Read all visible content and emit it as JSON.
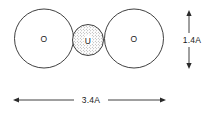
{
  "figure": {
    "background_color": "#ffffff",
    "stroke_color": "#2a2a2a",
    "text_color": "#1a1a1a",
    "atoms": [
      {
        "id": "oxygen-left",
        "label": "O",
        "element": "O",
        "style": "outline",
        "cx": 44,
        "cy": 38.5,
        "r": 29.5
      },
      {
        "id": "uranium-center",
        "label": "U",
        "element": "U",
        "style": "stippled",
        "cx": 88,
        "cy": 40,
        "r": 15.5
      },
      {
        "id": "oxygen-right",
        "label": "O",
        "element": "O",
        "style": "outline",
        "cx": 134,
        "cy": 38.5,
        "r": 29.5
      }
    ],
    "dimensions": [
      {
        "id": "vertical-dimension",
        "label": "1.4A",
        "value": "1.4",
        "unit": "A",
        "orientation": "vertical",
        "x": 189,
        "y_start": 11,
        "y_end": 68,
        "label_x": 193,
        "label_y": 40
      },
      {
        "id": "horizontal-dimension",
        "label": "3.4A",
        "value": "3.4",
        "unit": "A",
        "orientation": "horizontal",
        "y": 100,
        "x_start": 14,
        "x_end": 165,
        "label_x": 91,
        "label_y": 99
      }
    ]
  }
}
